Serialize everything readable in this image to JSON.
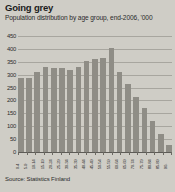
{
  "header": {
    "title": "Going grey",
    "subtitle": "Population distribution by age group, end-2006, '000"
  },
  "footer": {
    "source": "Source: Statistics Finland"
  },
  "colors": {
    "background": "#cfcdc6",
    "bar": "#8f8d86",
    "gridline": "#a8a69f",
    "axis": "#5d5b56",
    "text": "#1c1c1c"
  },
  "chart_data": {
    "type": "bar",
    "title": "Going grey",
    "subtitle": "Population distribution by age group, end-2006, '000",
    "xlabel": "",
    "ylabel": "",
    "unit": "thousands",
    "ylim": [
      0,
      450
    ],
    "yticks": [
      0,
      50,
      100,
      150,
      200,
      250,
      300,
      350,
      400,
      450
    ],
    "ytick_labels": [
      "0",
      "50",
      "100",
      "150",
      "200",
      "250",
      "300",
      "350",
      "400",
      "450"
    ],
    "grid": true,
    "legend": "none",
    "categories": [
      "0-4",
      "5-9",
      "10-14",
      "15-19",
      "20-24",
      "25-29",
      "30-34",
      "35-39",
      "40-44",
      "45-49",
      "50-54",
      "55-59",
      "60-64",
      "65-69",
      "70-74",
      "75-79",
      "80-84",
      "85-89",
      "90-"
    ],
    "values": [
      286,
      288,
      310,
      330,
      325,
      324,
      318,
      330,
      355,
      360,
      365,
      405,
      310,
      262,
      214,
      172,
      120,
      68,
      28
    ]
  }
}
